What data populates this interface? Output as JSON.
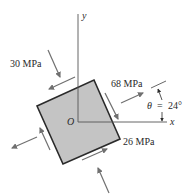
{
  "diagram": {
    "type": "plane-stress-element",
    "axes": {
      "x_label": "x",
      "y_label": "y",
      "origin_label": "O"
    },
    "stresses": {
      "normal_1": "68 MPa",
      "normal_2": "26 MPa",
      "shear": "30 MPa"
    },
    "angle": {
      "symbol": "θ",
      "equals": "=",
      "value": "24°"
    },
    "colors": {
      "element_fill": "#c4c4c4",
      "element_stroke": "#2a2a2a",
      "arrow": "#707070",
      "axis": "#555555",
      "text": "#2a2a2a"
    }
  }
}
